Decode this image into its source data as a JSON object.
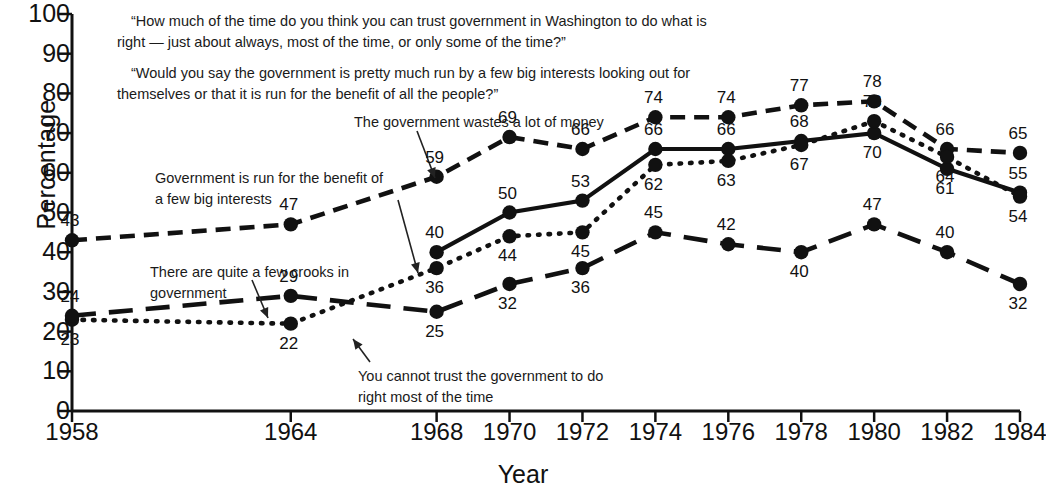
{
  "chart_data": {
    "type": "line",
    "title": "",
    "xlabel": "Year",
    "ylabel": "Percentage",
    "ylim": [
      0,
      100
    ],
    "ytick_step": 10,
    "ytick_labels": [
      "0",
      "10",
      "20",
      "30",
      "40",
      "50",
      "60",
      "70",
      "80",
      "90",
      "100"
    ],
    "grid": false,
    "legend_position": "in-plot annotations",
    "categories": [
      1958,
      1964,
      1968,
      1970,
      1972,
      1974,
      1976,
      1978,
      1980,
      1982,
      1984
    ],
    "xtick_labels": [
      "1958",
      "1964",
      "1968",
      "1970",
      "1972",
      "1974",
      "1976",
      "1978",
      "1980",
      "1982",
      "1984"
    ],
    "series": [
      {
        "name": "The government wastes a lot of money",
        "style": "dashed",
        "x": [
          1958,
          1964,
          1968,
          1970,
          1972,
          1974,
          1976,
          1978,
          1980,
          1982,
          1984
        ],
        "values": [
          43,
          47,
          59,
          69,
          66,
          74,
          74,
          77,
          78,
          66,
          65
        ],
        "label_positions": [
          "above",
          "above",
          "above",
          "above",
          "above",
          "above",
          "above",
          "above",
          "above",
          "above",
          "above"
        ]
      },
      {
        "name": "Government is run for the benefit of a few big interests",
        "style": "solid",
        "x": [
          1968,
          1970,
          1972,
          1974,
          1976,
          1978,
          1980,
          1982,
          1984
        ],
        "values": [
          40,
          50,
          53,
          66,
          66,
          68,
          70,
          61,
          55
        ],
        "label_positions": [
          "above",
          "above",
          "above",
          "above",
          "above",
          "above",
          "below",
          "below",
          "above"
        ]
      },
      {
        "name": "You cannot trust the government to do right most of the time",
        "style": "dotted",
        "x": [
          1958,
          1964,
          1968,
          1970,
          1972,
          1974,
          1976,
          1978,
          1980,
          1982,
          1984
        ],
        "values": [
          23,
          22,
          36,
          44,
          45,
          62,
          63,
          67,
          73,
          64,
          54
        ],
        "label_positions": [
          "below",
          "below",
          "below",
          "below",
          "below",
          "below",
          "below",
          "below",
          "above",
          "below",
          "below"
        ]
      },
      {
        "name": "There are quite a few crooks in government",
        "style": "long-dash",
        "x": [
          1958,
          1964,
          1968,
          1970,
          1972,
          1974,
          1976,
          1978,
          1980,
          1982,
          1984
        ],
        "values": [
          24,
          29,
          25,
          32,
          36,
          45,
          42,
          40,
          47,
          40,
          32
        ],
        "label_positions": [
          "above",
          "above",
          "below",
          "below",
          "below",
          "above",
          "above",
          "below",
          "above",
          "above",
          "below"
        ]
      }
    ]
  },
  "questions": {
    "q1": "“How much of the time do you think you can trust government in Washington to do what is right — just about always, most of the time, or only some of the time?”",
    "q2": "“Would you say the government is pretty much run by a few big interests looking out for themselves or that it is run for the benefit of all the people?”"
  },
  "annotations": {
    "waste": "The government wastes a lot of money",
    "interests": "Government is run for the benefit of a few big interests",
    "crooks": "There are quite a few crooks in government",
    "trust": "You cannot trust the government to do right most of the time"
  },
  "axes": {
    "ylabel": "Percentage",
    "xlabel": "Year"
  },
  "colors": {
    "ink": "#111111",
    "background": "#ffffff"
  }
}
